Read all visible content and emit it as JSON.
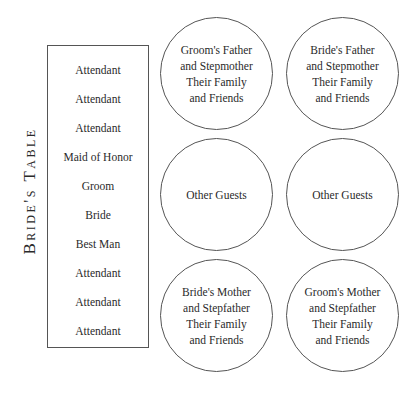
{
  "diagram": {
    "type": "wedding-seating-plan",
    "head_table": {
      "label": "Bride's Table",
      "seats": [
        "Attendant",
        "Attendant",
        "Attendant",
        "Maid of Honor",
        "Groom",
        "Bride",
        "Best Man",
        "Attendant",
        "Attendant",
        "Attendant"
      ]
    },
    "guest_tables": [
      {
        "lines": [
          "Groom's Father",
          "and Stepmother",
          "Their Family",
          "and Friends"
        ]
      },
      {
        "lines": [
          "Bride's Father",
          "and Stepmother",
          "Their Family",
          "and Friends"
        ]
      },
      {
        "lines": [
          "Other Guests"
        ]
      },
      {
        "lines": [
          "Other Guests"
        ]
      },
      {
        "lines": [
          "Bride's Mother",
          "and Stepfather",
          "Their Family",
          "and Friends"
        ]
      },
      {
        "lines": [
          "Groom's Mother",
          "and Stepfather",
          "Their Family",
          "and Friends"
        ]
      }
    ],
    "colors": {
      "stroke": "#555555",
      "text": "#2a2a2a",
      "background": "#ffffff"
    }
  }
}
